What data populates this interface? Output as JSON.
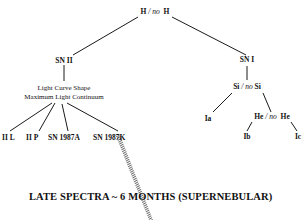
{
  "diagram": {
    "root": {
      "left": "H",
      "sep": " / ",
      "mid": "no",
      "right": "H"
    },
    "sn2": {
      "label": "SN II"
    },
    "sn1": {
      "label": "SN I"
    },
    "criteria": {
      "line1": "Light Curve Shape",
      "line2": "Maximum Light Continuum"
    },
    "si": {
      "left": "Si",
      "sep": " / ",
      "mid": "no",
      "right": "Si"
    },
    "he": {
      "left": "He",
      "sep": " / ",
      "mid": "no",
      "right": "He"
    },
    "leaves_sn2": [
      "II L",
      "II P",
      "SN 1987A",
      "SN 1987K"
    ],
    "ia": "Ia",
    "ib": "Ib",
    "ic": "Ic",
    "title": "LATE SPECTRA ~ 6 MONTHS (SUPERNEBULAR)",
    "colors": {
      "line": "#1a1a1a",
      "hatch": "#7a7a7a"
    }
  }
}
